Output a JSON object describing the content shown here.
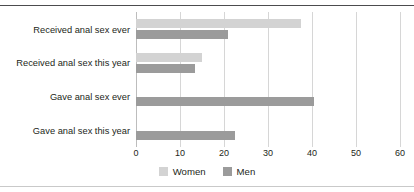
{
  "chart_data": {
    "type": "bar",
    "orientation": "horizontal",
    "title": "",
    "xlabel": "",
    "ylabel": "",
    "xlim": [
      0,
      60
    ],
    "xticks": [
      0,
      10,
      20,
      30,
      40,
      50,
      60
    ],
    "grid": true,
    "legend_position": "bottom-center",
    "categories": [
      "Received anal sex ever",
      "Received anal sex this year",
      "Gave anal sex ever",
      "Gave anal sex this year"
    ],
    "series": [
      {
        "name": "Women",
        "color": "#d3d3d3",
        "values": [
          37.5,
          15,
          null,
          null
        ]
      },
      {
        "name": "Men",
        "color": "#9b9b9b",
        "values": [
          21,
          13.5,
          40.5,
          22.5
        ]
      }
    ]
  },
  "legend": {
    "items": [
      {
        "label": "Women",
        "swatch": "women-swatch"
      },
      {
        "label": "Men",
        "swatch": "men-swatch"
      }
    ]
  }
}
